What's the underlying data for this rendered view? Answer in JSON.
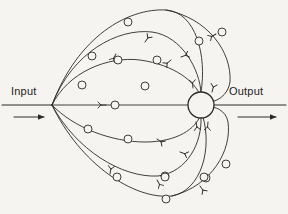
{
  "figure": {
    "background_color": "#f6f4f0",
    "ink_color": "#2a2a2a",
    "node_fill_color": "#f6f4f0",
    "width": 288,
    "height": 214
  },
  "labels": {
    "input": "Input",
    "output": "Output"
  },
  "icons": {
    "input_arrow": "arrow-right-icon",
    "output_arrow": "arrow-right-icon"
  },
  "geometry": {
    "branch_point": {
      "x": 52,
      "y": 105
    },
    "hub": {
      "cx": 201,
      "cy": 105,
      "r": 13
    },
    "input_axis": {
      "x1": 2,
      "y1": 105,
      "x2": 52,
      "y2": 105
    },
    "output_axis": {
      "x1": 214,
      "y1": 105,
      "x2": 286,
      "y2": 105
    },
    "input_arrow": {
      "x1": 14,
      "y1": 117,
      "x2": 44,
      "y2": 117
    },
    "output_arrow": {
      "x1": 238,
      "y1": 117,
      "x2": 276,
      "y2": 117
    }
  },
  "paths": [
    {
      "id": "upper-1",
      "d": "M 52 105 C 78 36, 128 8, 166 10 C 196 12, 207 56, 201 92",
      "name": "branch-path-upper-outer"
    },
    {
      "id": "upper-2",
      "d": "M 52 105 C 72 52, 118 28, 152 32 C 182 36, 200 70, 201 93",
      "name": "branch-path-upper-mid"
    },
    {
      "id": "upper-3",
      "d": "M 52 105 C 68 72, 108 56, 140 60 C 175 65, 195 82, 200 95",
      "name": "branch-path-upper-inner"
    },
    {
      "id": "middle",
      "d": "M 52 105 L 188 105",
      "name": "branch-path-middle"
    },
    {
      "id": "lower-1",
      "d": "M 52 105 C 74 128, 112 142, 145 142 C 178 142, 196 128, 200 116",
      "name": "branch-path-lower-inner"
    },
    {
      "id": "lower-2",
      "d": "M 52 105 C 76 150, 122 178, 158 176 C 188 172, 202 142, 201 118",
      "name": "branch-path-lower-mid"
    },
    {
      "id": "lower-3",
      "d": "M 52 105 C 80 164, 134 200, 172 196 C 202 190, 212 148, 203 117",
      "name": "branch-path-lower-outer"
    },
    {
      "id": "outer-right-upper",
      "d": "M 166 10 C 208 18, 232 52, 230 82 C 228 96, 216 102, 209 102",
      "name": "branch-path-right-upper-outer"
    },
    {
      "id": "outer-right-lower",
      "d": "M 172 196 C 212 186, 232 150, 228 122 C 226 110, 214 106, 209 107",
      "name": "branch-path-right-lower-outer"
    }
  ],
  "nodes": [
    {
      "cx": 128,
      "cy": 22,
      "r": 4,
      "name": "node-circle"
    },
    {
      "cx": 92,
      "cy": 56,
      "r": 4,
      "name": "node-circle"
    },
    {
      "cx": 118,
      "cy": 60,
      "r": 4,
      "name": "node-circle"
    },
    {
      "cx": 157,
      "cy": 60,
      "r": 4,
      "name": "node-circle"
    },
    {
      "cx": 222,
      "cy": 32,
      "r": 4,
      "name": "node-circle"
    },
    {
      "cx": 199,
      "cy": 41,
      "r": 4,
      "name": "node-circle"
    },
    {
      "cx": 82,
      "cy": 85,
      "r": 4,
      "name": "node-circle"
    },
    {
      "cx": 145,
      "cy": 86,
      "r": 4,
      "name": "node-circle"
    },
    {
      "cx": 115,
      "cy": 105,
      "r": 4,
      "name": "node-circle"
    },
    {
      "cx": 88,
      "cy": 129,
      "r": 4,
      "name": "node-circle"
    },
    {
      "cx": 128,
      "cy": 139,
      "r": 4,
      "name": "node-circle"
    },
    {
      "cx": 117,
      "cy": 177,
      "r": 4,
      "name": "node-circle"
    },
    {
      "cx": 165,
      "cy": 176,
      "r": 4,
      "name": "node-circle"
    },
    {
      "cx": 166,
      "cy": 199,
      "r": 4,
      "name": "node-circle"
    },
    {
      "cx": 206,
      "cy": 178,
      "r": 4,
      "name": "node-circle"
    },
    {
      "cx": 165,
      "cy": 177,
      "r": 4,
      "name": "node-circle"
    },
    {
      "cx": 204,
      "cy": 177,
      "r": 4,
      "name": "node-circle"
    },
    {
      "cx": 226,
      "cy": 164,
      "r": 4,
      "name": "node-circle"
    }
  ],
  "branch_marks": [
    {
      "x": 145,
      "y": 42,
      "rot": -55,
      "name": "branch-stub-mark"
    },
    {
      "x": 181,
      "y": 57,
      "rot": -20,
      "name": "branch-stub-mark"
    },
    {
      "x": 171,
      "y": 60,
      "rot": 140,
      "name": "branch-stub-mark"
    },
    {
      "x": 106,
      "y": 105,
      "rot": 180,
      "name": "branch-stub-mark"
    },
    {
      "x": 116,
      "y": 54,
      "rot": 120,
      "name": "branch-stub-mark"
    },
    {
      "x": 157,
      "y": 139,
      "rot": 35,
      "name": "branch-stub-mark"
    },
    {
      "x": 180,
      "y": 152,
      "rot": 20,
      "name": "branch-stub-mark"
    },
    {
      "x": 110,
      "y": 174,
      "rot": -80,
      "name": "branch-stub-mark"
    },
    {
      "x": 157,
      "y": 180,
      "rot": 60,
      "name": "branch-stub-mark"
    },
    {
      "x": 196,
      "y": 122,
      "rot": 80,
      "name": "branch-stub-mark"
    },
    {
      "x": 208,
      "y": 122,
      "rot": 95,
      "name": "branch-stub-mark"
    },
    {
      "x": 193,
      "y": 88,
      "rot": -95,
      "name": "branch-stub-mark"
    },
    {
      "x": 212,
      "y": 92,
      "rot": -75,
      "name": "branch-stub-mark"
    },
    {
      "x": 216,
      "y": 34,
      "rot": 150,
      "name": "branch-stub-mark"
    },
    {
      "x": 200,
      "y": 186,
      "rot": 55,
      "name": "branch-stub-mark"
    }
  ]
}
